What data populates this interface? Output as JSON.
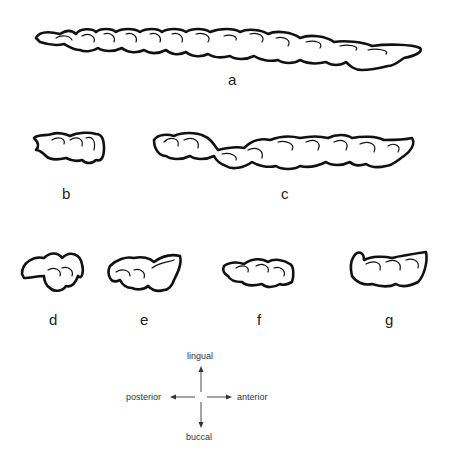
{
  "figure": {
    "panels": [
      {
        "id": "a",
        "label": "a",
        "description": "upper tooth row, occlusal outline drawing"
      },
      {
        "id": "b",
        "label": "b",
        "description": "single tooth outline"
      },
      {
        "id": "c",
        "label": "c",
        "description": "tooth row outline"
      },
      {
        "id": "d",
        "label": "d",
        "description": "single tooth outline"
      },
      {
        "id": "e",
        "label": "e",
        "description": "single tooth outline"
      },
      {
        "id": "f",
        "label": "f",
        "description": "single tooth outline"
      },
      {
        "id": "g",
        "label": "g",
        "description": "single tooth outline"
      }
    ],
    "orientation": {
      "up": "lingual",
      "down": "buccal",
      "left": "posterior",
      "right": "anterior"
    },
    "colors": {
      "ink": "#111111",
      "background": "#ffffff"
    }
  }
}
